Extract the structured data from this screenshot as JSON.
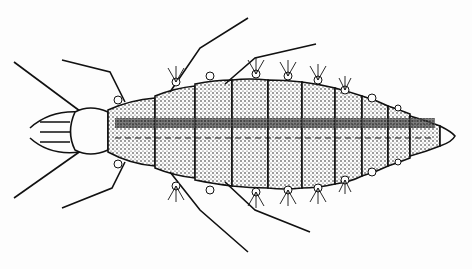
{
  "image": {
    "subject": "lacewing larva illustration",
    "style": "black ink stipple drawing on white",
    "colors": {
      "ink": "#111111",
      "paper": "#fdfdfd",
      "stipple": "#333333"
    }
  }
}
